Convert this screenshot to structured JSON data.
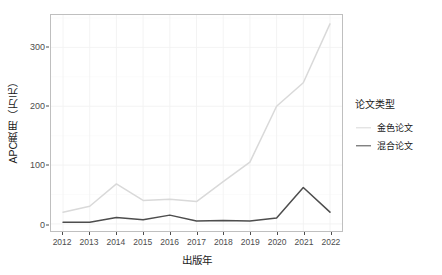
{
  "chart_data": {
    "type": "line",
    "title": "",
    "xlabel": "出版年",
    "ylabel": "APC费用（万元）",
    "x": [
      "2012",
      "2013",
      "2014",
      "2015",
      "2016",
      "2017",
      "2018",
      "2019",
      "2020",
      "2021",
      "2022"
    ],
    "categories": [
      "2012",
      "2013",
      "2014",
      "2015",
      "2016",
      "2017",
      "2018",
      "2019",
      "2020",
      "2021",
      "2022"
    ],
    "series": [
      {
        "name": "金色论文",
        "color": "#d9d9d9",
        "values": [
          20,
          30,
          68,
          40,
          42,
          38,
          72,
          105,
          200,
          240,
          340
        ]
      },
      {
        "name": "混合论文",
        "color": "#4d4d4d",
        "values": [
          3,
          3,
          11,
          7,
          15,
          5,
          6,
          5,
          10,
          62,
          20
        ]
      }
    ],
    "ylim": [
      -12,
      355
    ],
    "yticks": [
      0,
      100,
      200,
      300
    ],
    "ytick_labels": [
      "0",
      "100",
      "200",
      "300"
    ],
    "xlim": [
      2011.55,
      2022.45
    ],
    "grid": true,
    "legend_position": "right"
  },
  "legend": {
    "title": "论文类型",
    "items": [
      {
        "label": "金色论文",
        "color": "#d9d9d9"
      },
      {
        "label": "混合论文",
        "color": "#4d4d4d"
      }
    ]
  },
  "axes": {
    "x_title": "出版年",
    "y_title": "APC费用（万元）",
    "y_ticks": [
      "0",
      "100",
      "200",
      "300"
    ],
    "x_ticks": [
      "2012",
      "2013",
      "2014",
      "2015",
      "2016",
      "2017",
      "2018",
      "2019",
      "2020",
      "2021",
      "2022"
    ]
  },
  "style": {
    "panel_border": "#bfbfbf",
    "grid_color": "#f2f2f2",
    "tick_color": "#4d4d4d",
    "text_color": "#1a1a1a",
    "background": "#ffffff"
  }
}
